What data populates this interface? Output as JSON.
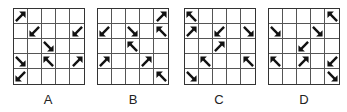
{
  "diagram": {
    "grid_size": 5,
    "panels": [
      {
        "label": "A",
        "arrows": [
          {
            "row": 0,
            "col": 0,
            "dir": "NE"
          },
          {
            "row": 1,
            "col": 1,
            "dir": "SW"
          },
          {
            "row": 1,
            "col": 4,
            "dir": "SW"
          },
          {
            "row": 2,
            "col": 2,
            "dir": "SE"
          },
          {
            "row": 3,
            "col": 0,
            "dir": "SE"
          },
          {
            "row": 3,
            "col": 2,
            "dir": "NW"
          },
          {
            "row": 3,
            "col": 4,
            "dir": "NE"
          },
          {
            "row": 4,
            "col": 0,
            "dir": "SW"
          }
        ]
      },
      {
        "label": "B",
        "arrows": [
          {
            "row": 0,
            "col": 4,
            "dir": "NE"
          },
          {
            "row": 1,
            "col": 0,
            "dir": "SW"
          },
          {
            "row": 1,
            "col": 2,
            "dir": "SE"
          },
          {
            "row": 1,
            "col": 4,
            "dir": "NW"
          },
          {
            "row": 2,
            "col": 2,
            "dir": "NW"
          },
          {
            "row": 3,
            "col": 0,
            "dir": "NE"
          },
          {
            "row": 3,
            "col": 3,
            "dir": "NE"
          },
          {
            "row": 4,
            "col": 4,
            "dir": "NW"
          }
        ]
      },
      {
        "label": "C",
        "arrows": [
          {
            "row": 0,
            "col": 0,
            "dir": "NW"
          },
          {
            "row": 1,
            "col": 0,
            "dir": "NE"
          },
          {
            "row": 1,
            "col": 2,
            "dir": "SW"
          },
          {
            "row": 1,
            "col": 4,
            "dir": "SE"
          },
          {
            "row": 2,
            "col": 2,
            "dir": "NE"
          },
          {
            "row": 3,
            "col": 1,
            "dir": "NW"
          },
          {
            "row": 3,
            "col": 4,
            "dir": "NW"
          },
          {
            "row": 4,
            "col": 0,
            "dir": "SE"
          }
        ]
      },
      {
        "label": "D",
        "arrows": [
          {
            "row": 0,
            "col": 4,
            "dir": "NW"
          },
          {
            "row": 1,
            "col": 0,
            "dir": "SE"
          },
          {
            "row": 1,
            "col": 3,
            "dir": "SE"
          },
          {
            "row": 2,
            "col": 2,
            "dir": "SW"
          },
          {
            "row": 3,
            "col": 0,
            "dir": "NW"
          },
          {
            "row": 3,
            "col": 2,
            "dir": "NE"
          },
          {
            "row": 3,
            "col": 4,
            "dir": "SW"
          },
          {
            "row": 4,
            "col": 4,
            "dir": "SE"
          }
        ]
      }
    ],
    "colors": {
      "arrow": "#111111",
      "grid_line": "#555555",
      "label": "#222222"
    }
  }
}
